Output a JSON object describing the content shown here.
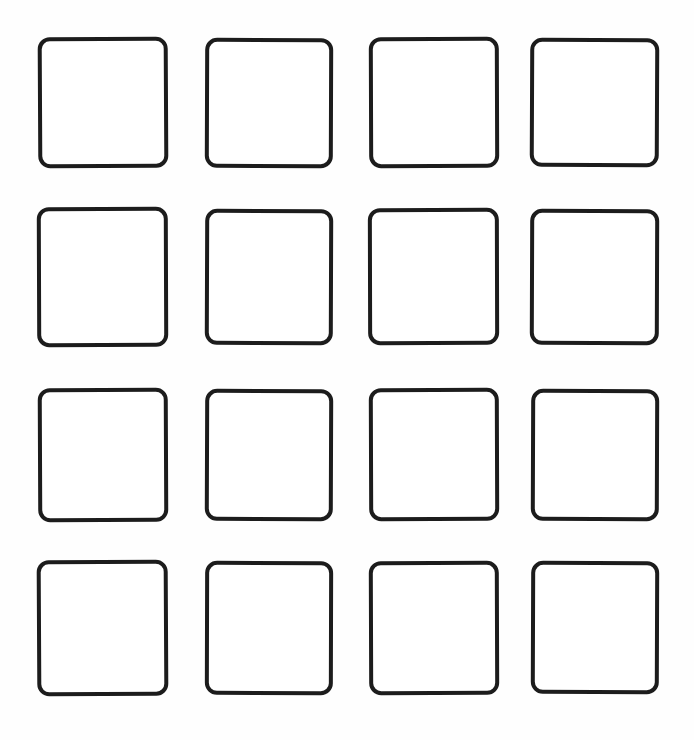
{
  "canvas": {
    "width": 694,
    "height": 740,
    "background_color": "#fefefe",
    "description": "Blank 4 by 4 grid of empty rounded-corner square outlines"
  },
  "style": {
    "stroke_color": "#1c1c1c",
    "fill_color": "#ffffff",
    "stroke_width_px": 4,
    "corner_radius_px": 12
  },
  "grid": {
    "rows": 4,
    "columns": 4,
    "total_cells": 16,
    "cells": [
      {
        "name": "cell-r1c1",
        "row": 1,
        "col": 1,
        "x": 38,
        "y": 37,
        "w": 130,
        "h": 131,
        "radius": 12,
        "stroke": 4,
        "rotate": -0.3,
        "label": ""
      },
      {
        "name": "cell-r1c2",
        "row": 1,
        "col": 2,
        "x": 205,
        "y": 38,
        "w": 128,
        "h": 130,
        "radius": 12,
        "stroke": 4,
        "rotate": 0.2,
        "label": ""
      },
      {
        "name": "cell-r1c3",
        "row": 1,
        "col": 3,
        "x": 369,
        "y": 37,
        "w": 130,
        "h": 131,
        "radius": 12,
        "stroke": 4,
        "rotate": -0.2,
        "label": ""
      },
      {
        "name": "cell-r1c4",
        "row": 1,
        "col": 4,
        "x": 530,
        "y": 38,
        "w": 129,
        "h": 129,
        "radius": 12,
        "stroke": 4,
        "rotate": 0.25,
        "label": ""
      },
      {
        "name": "cell-r2c1",
        "row": 2,
        "col": 1,
        "x": 37,
        "y": 207,
        "w": 131,
        "h": 140,
        "radius": 12,
        "stroke": 4,
        "rotate": -0.2,
        "label": ""
      },
      {
        "name": "cell-r2c2",
        "row": 2,
        "col": 2,
        "x": 205,
        "y": 209,
        "w": 128,
        "h": 136,
        "radius": 12,
        "stroke": 4,
        "rotate": 0.2,
        "label": ""
      },
      {
        "name": "cell-r2c3",
        "row": 2,
        "col": 3,
        "x": 368,
        "y": 208,
        "w": 131,
        "h": 137,
        "radius": 12,
        "stroke": 4,
        "rotate": -0.15,
        "label": ""
      },
      {
        "name": "cell-r2c4",
        "row": 2,
        "col": 4,
        "x": 530,
        "y": 209,
        "w": 129,
        "h": 136,
        "radius": 12,
        "stroke": 4,
        "rotate": 0.2,
        "label": ""
      },
      {
        "name": "cell-r3c1",
        "row": 3,
        "col": 1,
        "x": 38,
        "y": 388,
        "w": 130,
        "h": 134,
        "radius": 12,
        "stroke": 4,
        "rotate": -0.25,
        "label": ""
      },
      {
        "name": "cell-r3c2",
        "row": 3,
        "col": 2,
        "x": 205,
        "y": 389,
        "w": 128,
        "h": 132,
        "radius": 12,
        "stroke": 4,
        "rotate": 0.2,
        "label": ""
      },
      {
        "name": "cell-r3c3",
        "row": 3,
        "col": 3,
        "x": 369,
        "y": 388,
        "w": 130,
        "h": 133,
        "radius": 12,
        "stroke": 4,
        "rotate": -0.2,
        "label": ""
      },
      {
        "name": "cell-r3c4",
        "row": 3,
        "col": 4,
        "x": 531,
        "y": 389,
        "w": 128,
        "h": 132,
        "radius": 12,
        "stroke": 4,
        "rotate": 0.2,
        "label": ""
      },
      {
        "name": "cell-r4c1",
        "row": 4,
        "col": 1,
        "x": 37,
        "y": 560,
        "w": 131,
        "h": 136,
        "radius": 12,
        "stroke": 4,
        "rotate": -0.3,
        "label": ""
      },
      {
        "name": "cell-r4c2",
        "row": 4,
        "col": 2,
        "x": 205,
        "y": 561,
        "w": 128,
        "h": 134,
        "radius": 12,
        "stroke": 4,
        "rotate": 0.15,
        "label": ""
      },
      {
        "name": "cell-r4c3",
        "row": 4,
        "col": 3,
        "x": 369,
        "y": 561,
        "w": 130,
        "h": 134,
        "radius": 12,
        "stroke": 4,
        "rotate": -0.2,
        "label": ""
      },
      {
        "name": "cell-r4c4",
        "row": 4,
        "col": 4,
        "x": 531,
        "y": 561,
        "w": 128,
        "h": 133,
        "radius": 12,
        "stroke": 4,
        "rotate": 0.2,
        "label": ""
      }
    ]
  }
}
